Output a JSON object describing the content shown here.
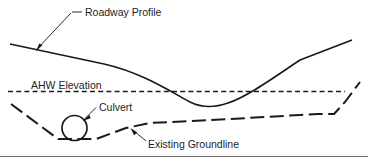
{
  "diagram": {
    "type": "engineering-cross-section",
    "background_color": "#ffffff",
    "line_color": "#1a1a1a",
    "rule_color": "#6e6e6e",
    "width": 368,
    "height": 164,
    "labels": {
      "roadway_profile": "Roadway Profile",
      "ahw_elevation": "AHW Elevation",
      "culvert": "Culvert",
      "existing_groundline": "Existing Groundline"
    },
    "elements": {
      "roadway_profile": {
        "name": "Roadway Profile",
        "style": "solid",
        "description": "Solid curve descending from left, bottoming in a sag vertical curve, then ascending to the right"
      },
      "ahw_elevation": {
        "name": "AHW Elevation",
        "style": "short-dashed",
        "description": "Horizontal short-dashed line marking the allowable headwater elevation"
      },
      "existing_groundline": {
        "name": "Existing Groundline",
        "style": "long-dashed",
        "description": "Long-dashed line showing natural ground, dipping at the channel then rising right"
      },
      "culvert": {
        "name": "Culvert",
        "shape": "circle",
        "description": "Circular culvert barrel section resting on the channel invert"
      }
    }
  }
}
